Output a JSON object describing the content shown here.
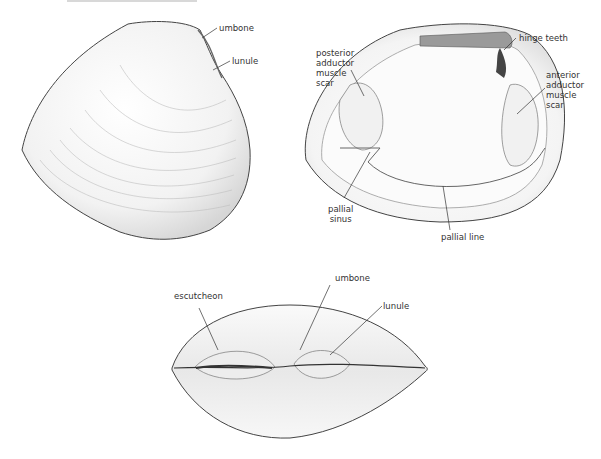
{
  "figure": {
    "views": [
      {
        "id": "exterior-side-view",
        "labels": [
          {
            "text": "umbone",
            "x": 219,
            "y": 23
          },
          {
            "text": "lunule",
            "x": 232,
            "y": 56
          }
        ]
      },
      {
        "id": "interior-view",
        "labels": [
          {
            "text": "hinge teeth",
            "x": 519,
            "y": 33
          },
          {
            "text": "posterior\nadductor\nmuscle\nscar",
            "x": 316,
            "y": 48
          },
          {
            "text": "anterior\nadductor\nmuscle\nscar",
            "x": 546,
            "y": 70
          },
          {
            "text": "pallial\nsinus",
            "x": 328,
            "y": 204
          },
          {
            "text": "pallial line",
            "x": 441,
            "y": 232
          }
        ]
      },
      {
        "id": "dorsal-view",
        "labels": [
          {
            "text": "escutcheon",
            "x": 174,
            "y": 291
          },
          {
            "text": "umbone",
            "x": 335,
            "y": 273
          },
          {
            "text": "lunule",
            "x": 383,
            "y": 301
          }
        ]
      }
    ]
  }
}
